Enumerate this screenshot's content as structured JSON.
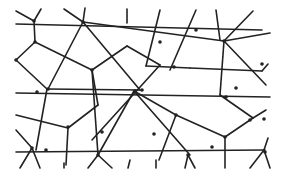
{
  "diagram": {
    "type": "voronoi-delaunay-mesh",
    "stroke_color": "#222222",
    "background_color": "#ffffff",
    "nodes": [
      [
        34,
        21
      ],
      [
        35,
        42
      ],
      [
        83,
        22
      ],
      [
        92,
        70
      ],
      [
        135,
        91
      ],
      [
        37,
        92
      ],
      [
        16,
        60
      ],
      [
        48,
        89
      ],
      [
        46,
        150
      ],
      [
        98,
        155
      ],
      [
        68,
        127
      ],
      [
        102,
        132
      ],
      [
        160,
        42
      ],
      [
        174,
        67
      ],
      [
        142,
        90
      ],
      [
        224,
        41
      ],
      [
        262,
        64
      ],
      [
        236,
        88
      ],
      [
        176,
        115
      ],
      [
        225,
        137
      ],
      [
        212,
        147
      ],
      [
        154,
        134
      ],
      [
        32,
        148
      ],
      [
        188,
        155
      ],
      [
        265,
        152
      ],
      [
        226,
        97
      ],
      [
        264,
        119
      ],
      [
        250,
        120
      ],
      [
        196,
        30
      ]
    ],
    "edges": [
      [
        16,
        24,
        262,
        30
      ],
      [
        16,
        11,
        34,
        21
      ],
      [
        41,
        9,
        34,
        21
      ],
      [
        34,
        21,
        35,
        42
      ],
      [
        35,
        42,
        16,
        60
      ],
      [
        35,
        42,
        92,
        70
      ],
      [
        64,
        9,
        83,
        22
      ],
      [
        85,
        8,
        83,
        22
      ],
      [
        83,
        22,
        48,
        89
      ],
      [
        83,
        22,
        140,
        90
      ],
      [
        83,
        22,
        224,
        41
      ],
      [
        224,
        41,
        270,
        33
      ],
      [
        224,
        41,
        253,
        11
      ],
      [
        216,
        10,
        220,
        40
      ],
      [
        224,
        41,
        220,
        95
      ],
      [
        224,
        41,
        266,
        85
      ],
      [
        160,
        10,
        146,
        66
      ],
      [
        196,
        10,
        170,
        70
      ],
      [
        146,
        66,
        190,
        68
      ],
      [
        190,
        68,
        262,
        71
      ],
      [
        262,
        71,
        268,
        64
      ],
      [
        127,
        9,
        127,
        23
      ],
      [
        92,
        70,
        127,
        46
      ],
      [
        127,
        46,
        160,
        65
      ],
      [
        160,
        65,
        92,
        140
      ],
      [
        16,
        93,
        270,
        97
      ],
      [
        47,
        89,
        16,
        60
      ],
      [
        47,
        89,
        36,
        150
      ],
      [
        47,
        89,
        140,
        90
      ],
      [
        92,
        70,
        98,
        155
      ],
      [
        16,
        115,
        68,
        128
      ],
      [
        68,
        128,
        98,
        105
      ],
      [
        98,
        105,
        92,
        70
      ],
      [
        68,
        128,
        66,
        165
      ],
      [
        16,
        130,
        32,
        148
      ],
      [
        16,
        152,
        265,
        150
      ],
      [
        32,
        148,
        20,
        168
      ],
      [
        32,
        148,
        40,
        168
      ],
      [
        134,
        91,
        176,
        115
      ],
      [
        176,
        115,
        225,
        137
      ],
      [
        225,
        137,
        253,
        118
      ],
      [
        253,
        118,
        266,
        110
      ],
      [
        253,
        118,
        220,
        95
      ],
      [
        134,
        91,
        98,
        155
      ],
      [
        134,
        91,
        190,
        155
      ],
      [
        176,
        115,
        159,
        160
      ],
      [
        225,
        137,
        225,
        168
      ],
      [
        264,
        150,
        250,
        168
      ],
      [
        264,
        150,
        270,
        168
      ],
      [
        264,
        150,
        268,
        138
      ],
      [
        98,
        155,
        88,
        168
      ],
      [
        98,
        155,
        112,
        168
      ],
      [
        188,
        155,
        185,
        168
      ],
      [
        188,
        155,
        195,
        168
      ],
      [
        156,
        160,
        156,
        168
      ],
      [
        64,
        163,
        64,
        168
      ],
      [
        130,
        160,
        128,
        168
      ]
    ]
  }
}
